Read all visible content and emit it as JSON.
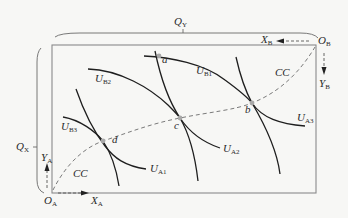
{
  "diagram": {
    "type": "edgeworth-box",
    "colors": {
      "background": "#f7f7f5",
      "box_border": "#8a8a8a",
      "curve": "#1e1e1e",
      "contract_curve": "#7a7a7a",
      "point_marker": "#a8a8a8",
      "text": "#2a2a2a"
    },
    "dimensions": {
      "width_label": {
        "main": "Q",
        "sub": "Y"
      },
      "height_label": {
        "main": "Q",
        "sub": "X"
      }
    },
    "origins": {
      "A": {
        "main": "O",
        "sub": "A"
      },
      "B": {
        "main": "O",
        "sub": "B"
      }
    },
    "axes": {
      "XA": {
        "main": "X",
        "sub": "A"
      },
      "YA": {
        "main": "Y",
        "sub": "A"
      },
      "XB": {
        "main": "X",
        "sub": "B"
      },
      "YB": {
        "main": "Y",
        "sub": "B"
      }
    },
    "indifference_curves": {
      "UA1": {
        "main": "U",
        "sub": "A1"
      },
      "UA2": {
        "main": "U",
        "sub": "A2"
      },
      "UA3": {
        "main": "U",
        "sub": "A3"
      },
      "UB1": {
        "main": "U",
        "sub": "B1"
      },
      "UB2": {
        "main": "U",
        "sub": "B2"
      },
      "UB3": {
        "main": "U",
        "sub": "B3"
      }
    },
    "contract_curve_labels": [
      "CC",
      "CC"
    ],
    "points": {
      "a": "a",
      "b": "b",
      "c": "c",
      "d": "d"
    }
  }
}
